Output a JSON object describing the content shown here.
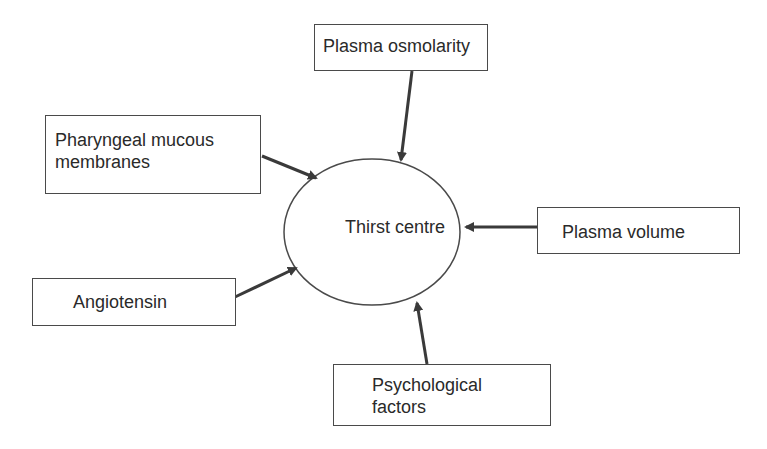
{
  "diagram": {
    "center": {
      "label_line1": "Thirst",
      "label_line2": "centre"
    },
    "inputs": [
      {
        "id": "plasma-osmolarity",
        "line1": "Plasma osmolarity",
        "line2": ""
      },
      {
        "id": "pharyngeal",
        "line1": "Pharyngeal mucous",
        "line2": "membranes"
      },
      {
        "id": "plasma-volume",
        "line1": "Plasma volume",
        "line2": ""
      },
      {
        "id": "angiotensin",
        "line1": "Angiotensin",
        "line2": ""
      },
      {
        "id": "psychological",
        "line1": "Psychological",
        "line2": "factors"
      }
    ],
    "colors": {
      "stroke": "#4a4a4a",
      "text": "#2a2a2a",
      "background": "#ffffff"
    }
  }
}
